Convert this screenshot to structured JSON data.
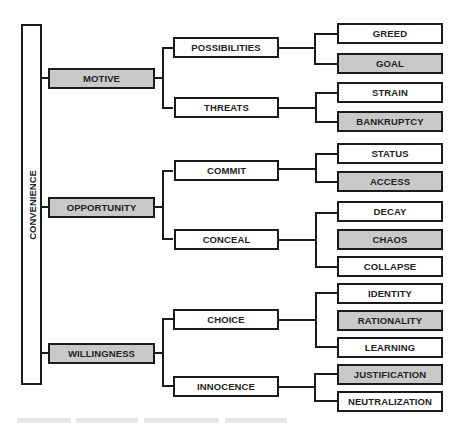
{
  "diagram": {
    "root": {
      "label": "CONVENIENCE"
    },
    "dimensions": [
      {
        "label": "MOTIVE",
        "shaded": true,
        "children": [
          {
            "label": "POSSIBILITIES",
            "children": [
              {
                "label": "GREED",
                "shaded": false
              },
              {
                "label": "GOAL",
                "shaded": true
              }
            ]
          },
          {
            "label": "THREATS",
            "children": [
              {
                "label": "STRAIN",
                "shaded": false
              },
              {
                "label": "BANKRUPTCY",
                "shaded": true
              }
            ]
          }
        ]
      },
      {
        "label": "OPPORTUNITY",
        "shaded": true,
        "children": [
          {
            "label": "COMMIT",
            "children": [
              {
                "label": "STATUS",
                "shaded": false
              },
              {
                "label": "ACCESS",
                "shaded": true
              }
            ]
          },
          {
            "label": "CONCEAL",
            "children": [
              {
                "label": "DECAY",
                "shaded": false
              },
              {
                "label": "CHAOS",
                "shaded": true
              },
              {
                "label": "COLLAPSE",
                "shaded": false
              }
            ]
          }
        ]
      },
      {
        "label": "WILLINGNESS",
        "shaded": true,
        "children": [
          {
            "label": "CHOICE",
            "children": [
              {
                "label": "IDENTITY",
                "shaded": false
              },
              {
                "label": "RATIONALITY",
                "shaded": true
              },
              {
                "label": "LEARNING",
                "shaded": false
              }
            ]
          },
          {
            "label": "INNOCENCE",
            "children": [
              {
                "label": "JUSTIFICATION",
                "shaded": true
              },
              {
                "label": "NEUTRALIZATION",
                "shaded": false
              }
            ]
          }
        ]
      }
    ]
  },
  "colors": {
    "shaded": "#c9c9c9",
    "border": "#1a1a1a",
    "background": "#ffffff"
  }
}
